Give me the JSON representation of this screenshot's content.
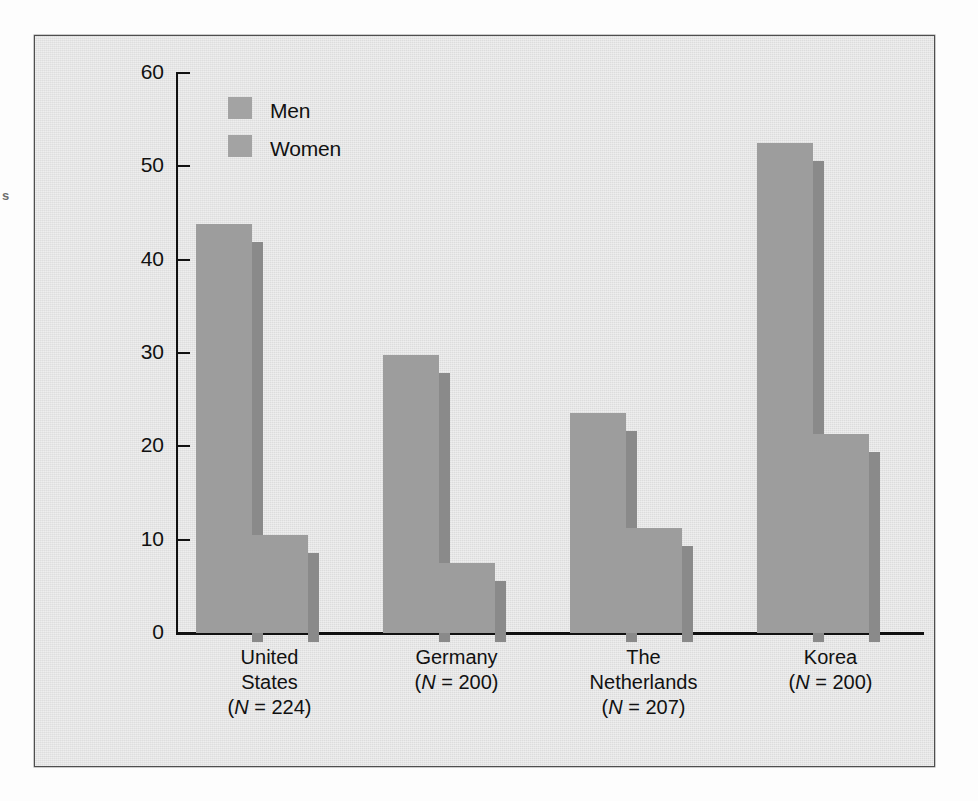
{
  "scan": {
    "edge_fragment": "s"
  },
  "chart_data": {
    "type": "bar",
    "title": "",
    "xlabel": "",
    "ylabel": "Percentage reporting more distress to sexual infidelity",
    "ylim": [
      0,
      60
    ],
    "ytick_labels": [
      "0",
      "10",
      "20",
      "30",
      "40",
      "50",
      "60"
    ],
    "yticks": [
      0,
      10,
      20,
      30,
      40,
      50,
      60
    ],
    "grid": false,
    "legend_position": "upper-left-inside",
    "categories": [
      "United States",
      "Germany",
      "The Netherlands",
      "Korea"
    ],
    "category_lines": [
      [
        "United",
        "States",
        "(N = 224)"
      ],
      [
        "Germany",
        "(N = 200)"
      ],
      [
        "The",
        "Netherlands",
        "(N = 207)"
      ],
      [
        "Korea",
        "(N = 200)"
      ]
    ],
    "sample_sizes": [
      224,
      200,
      207,
      200
    ],
    "series": [
      {
        "name": "Men",
        "values": [
          43.8,
          29.8,
          23.6,
          52.5
        ]
      },
      {
        "name": "Women",
        "values": [
          10.5,
          7.5,
          11.2,
          21.3
        ]
      }
    ],
    "colors": {
      "bar_face": "#9d9d9d",
      "bar_side": "#8a8a8a",
      "plot_background": "#e4e4e4",
      "axis": "#111111",
      "text": "#111111"
    }
  },
  "legend": {
    "items": [
      {
        "label": "Men"
      },
      {
        "label": "Women"
      }
    ]
  }
}
